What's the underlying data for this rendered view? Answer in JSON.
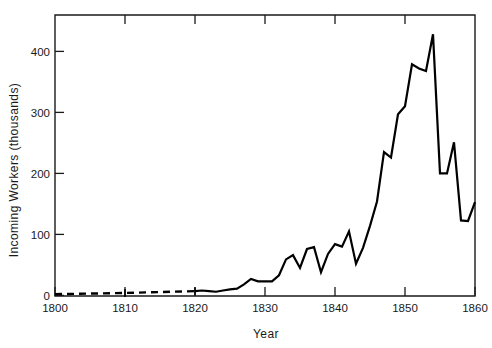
{
  "chart_data": {
    "type": "line",
    "title": "",
    "xlabel": "Year",
    "ylabel": "Incoming Workers (thousands)",
    "xlim": [
      1800,
      1860
    ],
    "ylim": [
      0,
      440
    ],
    "xticks": [
      1800,
      1810,
      1820,
      1830,
      1840,
      1850,
      1860
    ],
    "xticklabels": [
      "1800",
      "1810",
      "1820",
      "1830",
      "1840",
      "1850",
      "1860"
    ],
    "yticks": [
      0,
      100,
      200,
      300,
      400
    ],
    "yticklabels": [
      "0",
      "100",
      "200",
      "300",
      "400"
    ],
    "grid": false,
    "legend": false,
    "series": [
      {
        "name": "Incoming Workers (estimated)",
        "style": "dashed",
        "x": [
          1800,
          1810,
          1820
        ],
        "values": [
          2,
          4,
          7
        ]
      },
      {
        "name": "Incoming Workers (recorded)",
        "style": "solid",
        "x": [
          1820,
          1821,
          1822,
          1823,
          1824,
          1825,
          1826,
          1827,
          1828,
          1829,
          1830,
          1831,
          1832,
          1833,
          1834,
          1835,
          1836,
          1837,
          1838,
          1839,
          1840,
          1841,
          1842,
          1843,
          1844,
          1845,
          1846,
          1847,
          1848,
          1849,
          1850,
          1851,
          1852,
          1853,
          1854,
          1855,
          1856,
          1857,
          1858,
          1859,
          1860
        ],
        "values": [
          7,
          8,
          7,
          6,
          8,
          10,
          11,
          18,
          27,
          23,
          23,
          23,
          33,
          59,
          66,
          45,
          76,
          79,
          38,
          68,
          84,
          80,
          105,
          52,
          78,
          114,
          154,
          235,
          226,
          297,
          310,
          379,
          372,
          368,
          428,
          200,
          200,
          251,
          123,
          122,
          153
        ]
      }
    ],
    "annotations": {
      "dashed_series_note": "dashed segment 1800-1820",
      "peak_year": 1854,
      "peak_value": 428
    }
  },
  "axis": {
    "x_title": "Year",
    "y_title": "Incoming Workers (thousands)"
  }
}
